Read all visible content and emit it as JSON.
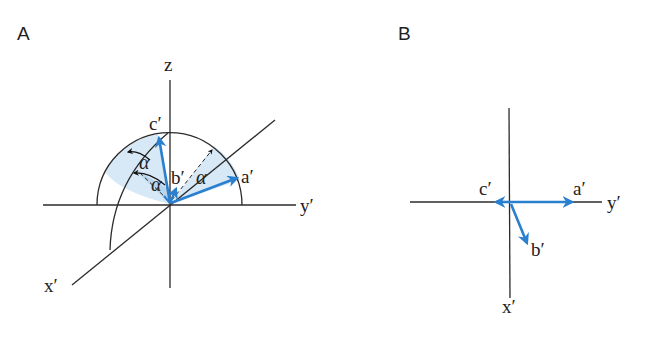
{
  "panels": {
    "a": {
      "label": "A",
      "axis_labels": {
        "z": "z",
        "y": "y′",
        "x": "x′"
      },
      "vector_labels": {
        "a": "a′",
        "b": "b′",
        "c": "c′"
      },
      "angle_labels": [
        "α",
        "α",
        "α"
      ]
    },
    "b": {
      "label": "B",
      "axis_labels": {
        "y": "y′",
        "x": "x′"
      },
      "vector_labels": {
        "a": "a′",
        "b": "b′",
        "c": "c′"
      }
    }
  },
  "colors": {
    "vector": "#2a7fcf",
    "shade": "#d7e8f6",
    "shade_dark": "#b9d5ee",
    "line": "#2b2b2b"
  }
}
